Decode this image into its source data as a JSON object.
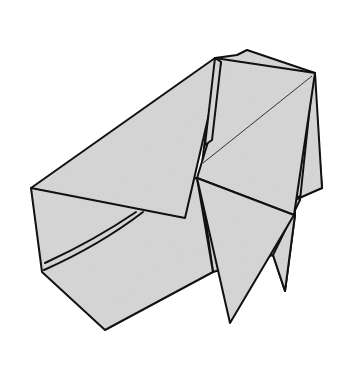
{
  "figure": {
    "paper_color": "#d6d6d6",
    "line_color": "#111111",
    "background": "#ffffff"
  }
}
